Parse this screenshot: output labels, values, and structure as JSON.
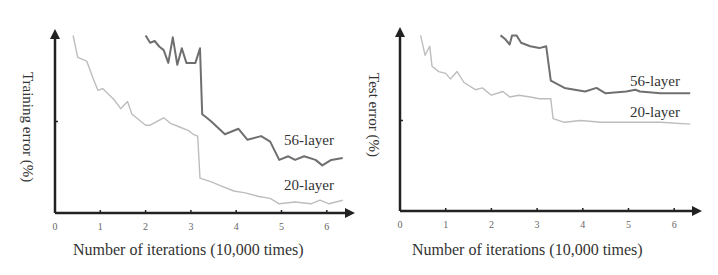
{
  "chart_data": [
    {
      "type": "line",
      "title": "",
      "xlabel": "Number of iterations (10,000 times)",
      "ylabel": "Training error (%)",
      "xticks": [
        "0",
        "1",
        "2",
        "3",
        "4",
        "5",
        "6"
      ],
      "xlim": [
        0,
        6.5
      ],
      "grid": false,
      "legend": "inline labels at right end of lines",
      "series": [
        {
          "name": "56-layer",
          "color": "#6f6f6f",
          "points": [
            [
              2.0,
              97
            ],
            [
              2.1,
              93
            ],
            [
              2.2,
              94
            ],
            [
              2.3,
              91
            ],
            [
              2.4,
              89
            ],
            [
              2.5,
              82
            ],
            [
              2.6,
              96
            ],
            [
              2.7,
              81
            ],
            [
              2.8,
              90
            ],
            [
              2.9,
              82
            ],
            [
              3.1,
              82
            ],
            [
              3.2,
              90
            ],
            [
              3.25,
              54
            ],
            [
              3.35,
              52
            ],
            [
              3.45,
              50
            ],
            [
              3.75,
              43
            ],
            [
              4.05,
              46
            ],
            [
              4.25,
              40
            ],
            [
              4.55,
              42
            ],
            [
              4.75,
              39
            ],
            [
              4.95,
              29
            ],
            [
              5.15,
              31
            ],
            [
              5.3,
              29
            ],
            [
              5.5,
              31
            ],
            [
              5.75,
              29
            ],
            [
              5.9,
              26
            ],
            [
              6.1,
              29
            ],
            [
              6.35,
              30
            ]
          ]
        },
        {
          "name": "20-layer",
          "color": "#bdbdbd",
          "points": [
            [
              0.4,
              97
            ],
            [
              0.5,
              85
            ],
            [
              0.7,
              83
            ],
            [
              0.85,
              73
            ],
            [
              0.95,
              67
            ],
            [
              1.05,
              68
            ],
            [
              1.3,
              62
            ],
            [
              1.45,
              57
            ],
            [
              1.6,
              61
            ],
            [
              1.7,
              54
            ],
            [
              1.8,
              52
            ],
            [
              2.0,
              48
            ],
            [
              2.1,
              48
            ],
            [
              2.4,
              52
            ],
            [
              2.55,
              49
            ],
            [
              2.75,
              47
            ],
            [
              2.95,
              45
            ],
            [
              3.05,
              43
            ],
            [
              3.15,
              42
            ],
            [
              3.2,
              19
            ],
            [
              3.45,
              17
            ],
            [
              3.65,
              15
            ],
            [
              3.95,
              12
            ],
            [
              4.2,
              11
            ],
            [
              4.5,
              9
            ],
            [
              4.75,
              8
            ],
            [
              4.95,
              5
            ],
            [
              5.3,
              6
            ],
            [
              5.65,
              5
            ],
            [
              5.85,
              7
            ],
            [
              6.05,
              5
            ],
            [
              6.35,
              7
            ]
          ]
        }
      ]
    },
    {
      "type": "line",
      "title": "",
      "xlabel": "Number of iterations (10,000 times)",
      "ylabel": "Test error (%)",
      "xticks": [
        "0",
        "1",
        "2",
        "3",
        "4",
        "5",
        "6"
      ],
      "xlim": [
        0,
        6.5
      ],
      "grid": false,
      "legend": "inline labels at right end of lines",
      "series": [
        {
          "name": "56-layer",
          "color": "#6f6f6f",
          "points": [
            [
              2.2,
              97
            ],
            [
              2.3,
              95
            ],
            [
              2.4,
              92
            ],
            [
              2.45,
              97
            ],
            [
              2.55,
              97
            ],
            [
              2.65,
              93
            ],
            [
              2.85,
              91
            ],
            [
              3.05,
              90
            ],
            [
              3.2,
              91
            ],
            [
              3.3,
              72
            ],
            [
              3.6,
              68
            ],
            [
              4.05,
              66
            ],
            [
              4.3,
              68
            ],
            [
              4.5,
              65
            ],
            [
              4.95,
              66
            ],
            [
              5.15,
              67
            ],
            [
              5.25,
              66
            ],
            [
              5.7,
              65
            ],
            [
              6.35,
              65
            ]
          ]
        },
        {
          "name": "20-layer",
          "color": "#bdbdbd",
          "points": [
            [
              0.45,
              97
            ],
            [
              0.55,
              86
            ],
            [
              0.65,
              91
            ],
            [
              0.7,
              80
            ],
            [
              0.85,
              77
            ],
            [
              1.0,
              76
            ],
            [
              1.1,
              73
            ],
            [
              1.25,
              77
            ],
            [
              1.4,
              71
            ],
            [
              1.65,
              67
            ],
            [
              1.8,
              68
            ],
            [
              2.0,
              64
            ],
            [
              2.25,
              66
            ],
            [
              2.4,
              63
            ],
            [
              2.6,
              64
            ],
            [
              2.85,
              63
            ],
            [
              3.05,
              62
            ],
            [
              3.3,
              62
            ],
            [
              3.35,
              51
            ],
            [
              3.6,
              49
            ],
            [
              3.95,
              50
            ],
            [
              4.4,
              49
            ],
            [
              4.85,
              49
            ],
            [
              5.25,
              49
            ],
            [
              5.7,
              49
            ],
            [
              6.35,
              48
            ]
          ]
        }
      ]
    }
  ],
  "left_chart": {
    "ylabel": "Training error (%)",
    "xlabel": "Number of iterations (10,000 times)",
    "label_56": "56-layer",
    "label_20": "20-layer",
    "ticks": [
      "0",
      "1",
      "2",
      "3",
      "4",
      "5",
      "6"
    ]
  },
  "right_chart": {
    "ylabel": "Test error (%)",
    "xlabel": "Number of iterations (10,000 times)",
    "label_56": "56-layer",
    "label_20": "20-layer",
    "ticks": [
      "0",
      "1",
      "2",
      "3",
      "4",
      "5",
      "6"
    ]
  }
}
